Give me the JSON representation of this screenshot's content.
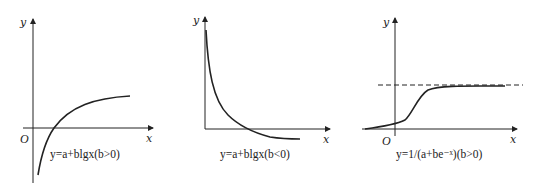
{
  "graphs": [
    {
      "id": "log-increasing",
      "axis_x_label": "x",
      "axis_y_label": "y",
      "origin_label": "O",
      "caption": "y=a+blgx(b>0)"
    },
    {
      "id": "log-decreasing",
      "axis_x_label": "x",
      "axis_y_label": "y",
      "origin_label": "",
      "caption": "y=a+blgx(b<0)"
    },
    {
      "id": "logistic",
      "axis_x_label": "x",
      "axis_y_label": "y",
      "origin_label": "O",
      "caption": "y=1/(a+be⁻ˣ)(b>0)",
      "asymptote": "dashed horizontal line"
    }
  ],
  "colors": {
    "ink": "#222222",
    "background": "#ffffff"
  }
}
